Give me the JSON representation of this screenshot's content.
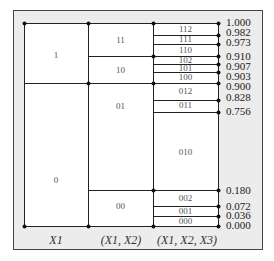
{
  "diagram": {
    "title": "",
    "columns": [
      {
        "axis_label_var": "X",
        "axis_label_sub": "1",
        "axis_label_text": "X1"
      },
      {
        "axis_label_text": "(X1, X2)"
      },
      {
        "axis_label_text": "(X1, X2, X3)"
      }
    ],
    "col1_cells": [
      {
        "label": "1",
        "from": 0.9,
        "to": 1.0
      },
      {
        "label": "0",
        "from": 0.0,
        "to": 0.9
      }
    ],
    "col2_cells": [
      {
        "label": "11",
        "from": 0.91,
        "to": 1.0
      },
      {
        "label": "10",
        "from": 0.9,
        "to": 0.91
      },
      {
        "label": "01",
        "from": 0.18,
        "to": 0.9
      },
      {
        "label": "00",
        "from": 0.0,
        "to": 0.18
      }
    ],
    "col3_cells": [
      {
        "label": "112",
        "from": 0.982,
        "to": 1.0
      },
      {
        "label": "111",
        "from": 0.973,
        "to": 0.982
      },
      {
        "label": "110",
        "from": 0.91,
        "to": 0.973
      },
      {
        "label": "102",
        "from": 0.907,
        "to": 0.91
      },
      {
        "label": "101",
        "from": 0.903,
        "to": 0.907
      },
      {
        "label": "100",
        "from": 0.9,
        "to": 0.903
      },
      {
        "label": "012",
        "from": 0.828,
        "to": 0.9
      },
      {
        "label": "011",
        "from": 0.756,
        "to": 0.828
      },
      {
        "label": "010",
        "from": 0.18,
        "to": 0.756
      },
      {
        "label": "002",
        "from": 0.072,
        "to": 0.18
      },
      {
        "label": "001",
        "from": 0.036,
        "to": 0.072
      },
      {
        "label": "000",
        "from": 0.0,
        "to": 0.036
      }
    ],
    "boundary_values": [
      "1.000",
      "0.982",
      "0.973",
      "0.910",
      "0.907",
      "0.903",
      "0.900",
      "0.828",
      "0.756",
      "0.180",
      "0.072",
      "0.036",
      "0.000"
    ],
    "colors": {
      "frame_bg": "#ececec",
      "cell_bg": "#ffffff",
      "line": "#222222"
    }
  }
}
